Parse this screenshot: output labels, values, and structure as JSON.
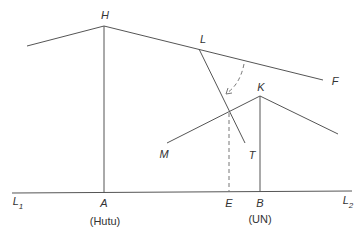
{
  "diagram": {
    "points": {
      "H": {
        "label": "H",
        "x": 104,
        "y": 26
      },
      "L": {
        "label": "L",
        "x": 199,
        "y": 49
      },
      "F": {
        "label": "F",
        "x": 323,
        "y": 80
      },
      "K": {
        "label": "K",
        "x": 260,
        "y": 96
      },
      "M": {
        "label": "M",
        "x": 167,
        "y": 143
      },
      "T": {
        "label": "T",
        "x": 245,
        "y": 143
      },
      "A": {
        "label": "A",
        "x": 104,
        "y": 193
      },
      "E": {
        "label": "E",
        "x": 229,
        "y": 193
      },
      "B": {
        "label": "B",
        "x": 260,
        "y": 193
      }
    },
    "labels": {
      "H": "H",
      "L": "L",
      "F": "F",
      "K": "K",
      "M": "M",
      "T": "T",
      "A": "A",
      "E": "E",
      "B": "B",
      "L1_main": "L",
      "L1_sub": "1",
      "L2_main": "L",
      "L2_sub": "2",
      "A_caption": "(Hutu)",
      "B_caption": "(UN)"
    },
    "colors": {
      "line": "#555555",
      "dashed": "#777777",
      "text": "#333333"
    }
  }
}
